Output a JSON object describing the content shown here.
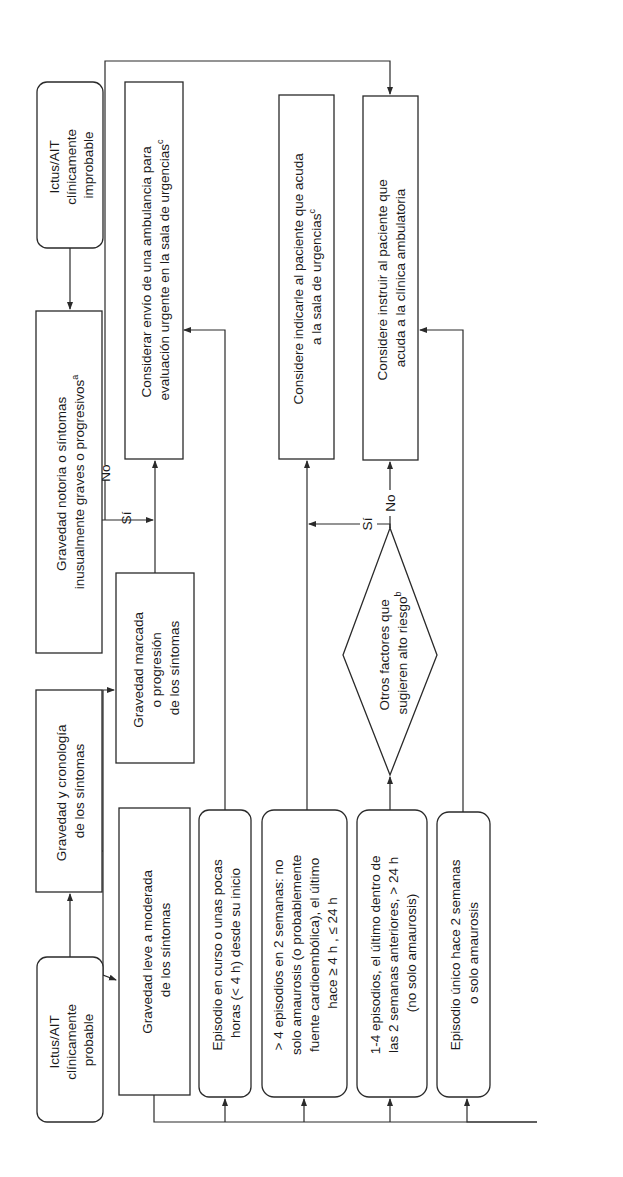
{
  "diagram": {
    "orientation": "rotated -90deg (text reads bottom to top)",
    "colors": {
      "line": "#2a2a2a",
      "text": "#1a1a1a",
      "background": "#ffffff"
    },
    "nodes": {
      "probable": {
        "lines": [
          "Ictus/AIT",
          "clínicamente",
          "probable"
        ],
        "shape": "rounded"
      },
      "improbable": {
        "lines": [
          "Ictus/AIT",
          "clínicamente",
          "improbable"
        ],
        "shape": "rounded"
      },
      "notoria": {
        "lines": [
          "Gravedad notoria o síntomas",
          "inusualmente graves o progresivos"
        ],
        "sup": "a",
        "shape": "rect"
      },
      "cronologia": {
        "lines": [
          "Gravedad y cronología",
          "de los síntomas"
        ],
        "shape": "rect"
      },
      "marcada": {
        "lines": [
          "Gravedad marcada",
          "o progresión",
          "de los síntomas"
        ],
        "shape": "rect"
      },
      "leve": {
        "lines": [
          "Gravedad leve a moderada",
          "de los síntomas"
        ],
        "shape": "rect"
      },
      "en_curso": {
        "lines": [
          "Episodio en curso o unas pocas",
          "horas (< 4 h) desde su inicio"
        ],
        "shape": "rounded"
      },
      "mas4": {
        "lines": [
          "> 4 episodios en 2 semanas: no",
          "solo amaurosis (o probablemente",
          "fuente cardioembólica), el último",
          "hace ≥ 4 h , ≤ 24 h"
        ],
        "shape": "rounded"
      },
      "uno_cuatro": {
        "lines": [
          "1-4 episodios, el último dentro de",
          "las 2 semanas anteriores, > 24 h",
          "(no solo amaurosis)"
        ],
        "shape": "rounded"
      },
      "unico": {
        "lines": [
          "Episodio único hace 2 semanas",
          "o solo amaurosis"
        ],
        "shape": "rounded"
      },
      "ambulancia": {
        "lines": [
          "Considerar envío de una ambulancia para",
          "evaluación urgente en la sala de urgencias"
        ],
        "sup": "c",
        "shape": "rect"
      },
      "indicarle": {
        "lines": [
          "Considere indicarle al paciente que acuda",
          "a la sala de urgencias"
        ],
        "sup": "c",
        "shape": "rect"
      },
      "instruir": {
        "lines": [
          "Considere instruir al paciente que",
          "acuda a la clínica ambulatoria"
        ],
        "shape": "rect"
      },
      "factores": {
        "lines": [
          "Otros factores que",
          "sugieren alto riesgo"
        ],
        "sup": "b",
        "shape": "diamond"
      }
    },
    "edge_labels": {
      "notoria_si": "Sí",
      "notoria_no": "No",
      "factores_si": "Sí",
      "factores_no": "No"
    }
  }
}
